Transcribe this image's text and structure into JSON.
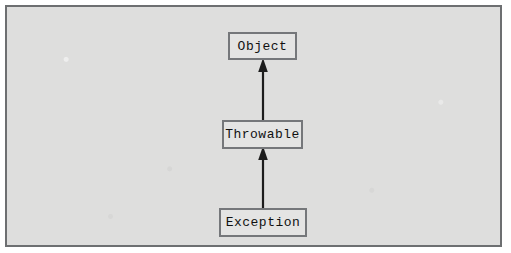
{
  "figure": {
    "diagram_type": "uml-class-hierarchy",
    "background_color": "#dededd",
    "frame_color": "#6d6f71",
    "node_fill_color": "#e4e4e3",
    "node_border_color": "#75777a",
    "edge_color": "#1c1c1c",
    "nodes": [
      {
        "id": "object",
        "label": "Object"
      },
      {
        "id": "throwable",
        "label": "Throwable"
      },
      {
        "id": "exception",
        "label": "Exception"
      }
    ],
    "edges": [
      {
        "id": "throwable-object",
        "from": "Throwable",
        "to": "Object",
        "relation": "extends",
        "arrow": "solid-triangle-up"
      },
      {
        "id": "exception-throwable",
        "from": "Exception",
        "to": "Throwable",
        "relation": "extends",
        "arrow": "solid-triangle-up"
      }
    ]
  }
}
